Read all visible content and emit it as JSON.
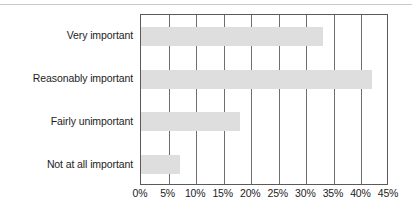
{
  "chart_data": {
    "type": "bar",
    "orientation": "horizontal",
    "title": "",
    "subtitle": "",
    "xlabel": "",
    "ylabel": "",
    "categories": [
      "Very important",
      "Reasonably important",
      "Fairly unimportant",
      "Not at all important"
    ],
    "values": [
      33,
      42,
      18,
      7
    ],
    "value_suffix": "%",
    "xlim": [
      0,
      45
    ],
    "xticks": [
      0,
      5,
      10,
      15,
      20,
      25,
      30,
      35,
      40,
      45
    ],
    "xtick_labels": [
      "0%",
      "5%",
      "10%",
      "15%",
      "20%",
      "25%",
      "30%",
      "35%",
      "40%",
      "45%"
    ],
    "grid": "vertical",
    "legend": "none",
    "bar_color": "#dedede",
    "frame_color": "#5a5a5a",
    "gridline_color": "#6e6e6e",
    "text_color": "#1d1d1d",
    "background": "#ffffff"
  }
}
